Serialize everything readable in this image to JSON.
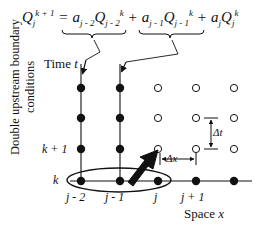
{
  "figure": {
    "type": "finite-difference-stencil-diagram",
    "equation": {
      "lhs": {
        "base": "Q",
        "sub": "j",
        "sup": "k + 1"
      },
      "terms": [
        {
          "coefficient": {
            "base": "a",
            "sub": "j - 2"
          },
          "variable": {
            "base": "Q",
            "sub": "j - 2",
            "sup": "k"
          },
          "operator": "="
        },
        {
          "coefficient": {
            "base": "a",
            "sub": "j - 1"
          },
          "variable": {
            "base": "Q",
            "sub": "j - 1",
            "sup": "k"
          },
          "operator": "+"
        },
        {
          "coefficient": {
            "base": "a",
            "sub": "j"
          },
          "variable": {
            "base": "Q",
            "sub": "j",
            "sup": "k"
          },
          "operator": "+"
        }
      ],
      "plain_text": "Q_j^{k+1} = a_{j-2} Q_{j-2}^k + a_{j-1} Q_{j-1}^k + a_j Q_j^k"
    },
    "axis_labels": {
      "time": "Time t",
      "time_static": "Time",
      "time_variable": "t",
      "space": "Space x",
      "space_static": "Space",
      "space_variable": "x",
      "side": "Double upstream boundary conditions"
    },
    "spacing_labels": {
      "delta_t": "Δt",
      "delta_x": "Δx"
    },
    "row_labels": [
      {
        "text": "k + 1",
        "y": 149
      },
      {
        "text": "k",
        "y": 181
      }
    ],
    "column_labels": [
      {
        "text": "j - 2",
        "x": 81
      },
      {
        "text": "j - 1",
        "x": 120
      },
      {
        "text": "j",
        "x": 158
      },
      {
        "text": "j + 1",
        "x": 196
      }
    ],
    "grid": {
      "columns_x": [
        81,
        120,
        158,
        196,
        234
      ],
      "rows_y": [
        88,
        118,
        149,
        181
      ],
      "boundary_columns": [
        0,
        1
      ],
      "filled_marker": "solid-dot",
      "open_marker": "open-circle",
      "node_radius_filled": 4.2,
      "node_radius_open": 3.6
    },
    "highlight": {
      "ellipse_label": "boundary-node-group",
      "ellipse_nodes": [
        "j - 2",
        "j - 1",
        "j"
      ],
      "ellipse_row": "k"
    },
    "stencil_arrow": {
      "from_node": "j - 1, k",
      "to_node": "j, k + 1",
      "style": "thick-black-arrow"
    },
    "callout_arrows": [
      {
        "label": "brace-1-pointer",
        "target_column": "j - 2"
      },
      {
        "label": "brace-2-pointer",
        "target_column": "j - 1"
      }
    ],
    "braces": [
      {
        "label": "underbrace-term-1",
        "covers": "a_{j-2} Q_{j-2}^k"
      },
      {
        "label": "underbrace-term-2",
        "covers": "a_{j-1} Q_{j-1}^k"
      }
    ],
    "colors": {
      "ink": "#111111",
      "background": "#ffffff",
      "grid_line": "#1a1a1a"
    }
  }
}
